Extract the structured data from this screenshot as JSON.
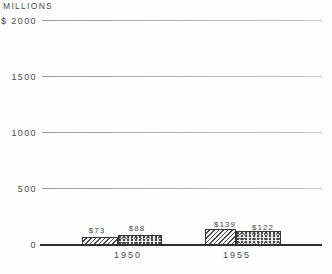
{
  "chart_data": {
    "type": "bar",
    "title": "",
    "y_axis_unit": "MILLIONS",
    "categories": [
      "1950",
      "1955"
    ],
    "series": [
      {
        "name": "hatched-series",
        "pattern": "diagonal-hatch",
        "values": [
          73,
          139
        ],
        "data_labels": [
          "$73",
          "$139"
        ]
      },
      {
        "name": "stippled-series",
        "pattern": "stipple",
        "values": [
          88,
          122
        ],
        "data_labels": [
          "$88",
          "$122"
        ]
      }
    ],
    "y_ticks": [
      {
        "label": "$ 2000",
        "value": 2000
      },
      {
        "label": "1500",
        "value": 1500
      },
      {
        "label": "1000",
        "value": 1000
      },
      {
        "label": "500",
        "value": 500
      },
      {
        "label": "0",
        "value": 0
      }
    ],
    "xlabel": "",
    "ylabel": "MILLIONS",
    "ylim": [
      0,
      2000
    ],
    "grid": true,
    "legend": "none",
    "colors": {
      "text": "#4a4a4a",
      "gridline": "#adadad",
      "baseline": "#2c2c2c",
      "bar_outline": "#333333",
      "background": "#fefefe"
    }
  }
}
